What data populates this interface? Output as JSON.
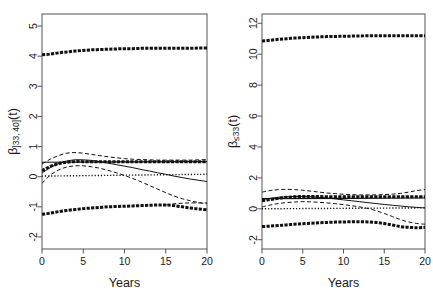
{
  "figure": {
    "type": "multi-panel-line-plot",
    "panel_count": 2,
    "background": "#ffffff",
    "line_color": "#111111"
  },
  "chart_data": [
    {
      "type": "line",
      "panel": "left",
      "title": "",
      "xlabel": "Years",
      "ylabel": "beta_]33,40](t)",
      "ylabel_parts": {
        "beta": "β",
        "subscript": "]33, 40]",
        "suffix": "(t)"
      },
      "xlim": [
        0,
        20
      ],
      "ylim": [
        -2.4,
        5.4
      ],
      "xticks": [
        0,
        5,
        10,
        15,
        20
      ],
      "xtick_labels": [
        "0",
        "5",
        "10",
        "15",
        "20"
      ],
      "yticks": [
        -2,
        -1,
        0,
        1,
        2,
        3,
        4,
        5
      ],
      "ytick_labels": [
        "-2",
        "-1",
        "0",
        "1",
        "2",
        "3",
        "4",
        "5"
      ],
      "grid": false,
      "legend": null,
      "series": [
        {
          "name": "upper-confidence-band",
          "style": "thick-dashed",
          "x": [
            0,
            1,
            2,
            3,
            4,
            5,
            6,
            7,
            8,
            9,
            10,
            11,
            12,
            13,
            14,
            15,
            16,
            17,
            18,
            19,
            20
          ],
          "values": [
            4.05,
            4.07,
            4.11,
            4.14,
            4.17,
            4.19,
            4.21,
            4.22,
            4.23,
            4.24,
            4.25,
            4.25,
            4.26,
            4.26,
            4.26,
            4.26,
            4.26,
            4.26,
            4.26,
            4.27,
            4.27
          ]
        },
        {
          "name": "lower-confidence-band",
          "style": "thick-dashed",
          "x": [
            0,
            1,
            2,
            3,
            4,
            5,
            6,
            7,
            8,
            9,
            10,
            11,
            12,
            13,
            14,
            15,
            16,
            17,
            18,
            19,
            20
          ],
          "values": [
            -1.25,
            -1.21,
            -1.16,
            -1.12,
            -1.09,
            -1.06,
            -1.04,
            -1.02,
            -1.0,
            -0.99,
            -0.98,
            -0.97,
            -0.96,
            -0.95,
            -0.94,
            -0.94,
            -0.96,
            -1.0,
            -1.04,
            -1.07,
            -1.1
          ]
        },
        {
          "name": "lower-band-upper-branch",
          "style": "dashed",
          "x": [
            15,
            16,
            17,
            18,
            19,
            20
          ],
          "values": [
            -0.94,
            -0.9,
            -0.88,
            -0.87,
            -0.87,
            -0.87
          ]
        },
        {
          "name": "constant-effect-estimate",
          "style": "solid-horizontal",
          "x": [
            0,
            20
          ],
          "values": [
            0.48,
            0.5
          ]
        },
        {
          "name": "zero-reference-line",
          "style": "dotted",
          "x": [
            0,
            20
          ],
          "values": [
            0.02,
            0.08
          ]
        },
        {
          "name": "time-varying-estimate",
          "style": "solid",
          "x": [
            0,
            1,
            2,
            3,
            4,
            5,
            6,
            7,
            8,
            9,
            10,
            11,
            12,
            13,
            14,
            15,
            16,
            17,
            18,
            19,
            20
          ],
          "values": [
            0.12,
            0.3,
            0.44,
            0.52,
            0.56,
            0.56,
            0.54,
            0.5,
            0.45,
            0.4,
            0.35,
            0.3,
            0.24,
            0.19,
            0.13,
            0.08,
            0.02,
            -0.03,
            -0.08,
            -0.12,
            -0.16
          ]
        },
        {
          "name": "time-varying-upper-ci",
          "style": "dashed",
          "x": [
            0,
            1,
            2,
            3,
            4,
            5,
            6,
            7,
            8,
            9,
            10,
            11,
            12,
            13,
            14,
            15,
            16,
            17,
            18,
            19,
            20
          ],
          "values": [
            0.42,
            0.58,
            0.7,
            0.78,
            0.8,
            0.78,
            0.74,
            0.7,
            0.66,
            0.63,
            0.6,
            0.58,
            0.57,
            0.56,
            0.55,
            0.55,
            0.55,
            0.55,
            0.55,
            0.56,
            0.57
          ]
        },
        {
          "name": "time-varying-lower-ci",
          "style": "dashed",
          "x": [
            0,
            1,
            2,
            3,
            4,
            5,
            6,
            7,
            8,
            9,
            10,
            11,
            12,
            13,
            14,
            15,
            16,
            17,
            18,
            19,
            20
          ],
          "values": [
            -0.22,
            0.05,
            0.22,
            0.32,
            0.36,
            0.36,
            0.33,
            0.28,
            0.21,
            0.13,
            0.04,
            -0.06,
            -0.17,
            -0.29,
            -0.41,
            -0.53,
            -0.64,
            -0.73,
            -0.8,
            -0.86,
            -0.9
          ]
        },
        {
          "name": "thick-dashed-mid-band",
          "style": "thick-dashed",
          "x": [
            0,
            1,
            2,
            3,
            4,
            5,
            6,
            7,
            8,
            9,
            10,
            11,
            12,
            13,
            14,
            15,
            16,
            17,
            18,
            19,
            20
          ],
          "values": [
            0.2,
            0.34,
            0.43,
            0.48,
            0.5,
            0.5,
            0.5,
            0.5,
            0.5,
            0.5,
            0.5,
            0.5,
            0.5,
            0.5,
            0.5,
            0.5,
            0.5,
            0.5,
            0.5,
            0.5,
            0.5
          ]
        }
      ]
    },
    {
      "type": "line",
      "panel": "right",
      "title": "",
      "xlabel": "Years",
      "ylabel": "beta_<=33(t)",
      "ylabel_parts": {
        "beta": "β",
        "subscript": "≤33",
        "suffix": "(t)"
      },
      "xlim": [
        0,
        20
      ],
      "ylim": [
        -2.6,
        12.6
      ],
      "xticks": [
        0,
        5,
        10,
        15,
        20
      ],
      "xtick_labels": [
        "0",
        "5",
        "10",
        "15",
        "20"
      ],
      "yticks": [
        -2,
        0,
        2,
        4,
        6,
        8,
        10,
        12
      ],
      "ytick_labels": [
        "-2",
        "0",
        "2",
        "4",
        "6",
        "8",
        "10",
        "12"
      ],
      "grid": false,
      "legend": null,
      "series": [
        {
          "name": "upper-confidence-band",
          "style": "thick-dashed",
          "x": [
            0,
            1,
            2,
            3,
            4,
            5,
            6,
            7,
            8,
            9,
            10,
            11,
            12,
            13,
            14,
            15,
            16,
            17,
            18,
            19,
            20
          ],
          "values": [
            10.85,
            10.9,
            10.96,
            11.0,
            11.04,
            11.07,
            11.1,
            11.12,
            11.14,
            11.15,
            11.16,
            11.17,
            11.18,
            11.19,
            11.2,
            11.2,
            11.2,
            11.2,
            11.2,
            11.2,
            11.2
          ]
        },
        {
          "name": "lower-confidence-band",
          "style": "thick-dashed",
          "x": [
            0,
            1,
            2,
            3,
            4,
            5,
            6,
            7,
            8,
            9,
            10,
            11,
            12,
            13,
            14,
            15,
            16,
            17,
            18,
            19,
            20
          ],
          "values": [
            -1.15,
            -1.12,
            -1.08,
            -1.04,
            -1.0,
            -0.96,
            -0.93,
            -0.9,
            -0.88,
            -0.86,
            -0.85,
            -0.84,
            -0.84,
            -0.85,
            -0.88,
            -0.95,
            -1.05,
            -1.15,
            -1.2,
            -1.22,
            -1.2
          ]
        },
        {
          "name": "constant-effect-estimate",
          "style": "solid-horizontal",
          "x": [
            0,
            20
          ],
          "values": [
            0.66,
            0.7
          ]
        },
        {
          "name": "zero-reference-line",
          "style": "dotted",
          "x": [
            0,
            20
          ],
          "values": [
            0.0,
            0.06
          ]
        },
        {
          "name": "time-varying-estimate",
          "style": "solid",
          "x": [
            0,
            1,
            2,
            3,
            4,
            5,
            6,
            7,
            8,
            9,
            10,
            11,
            12,
            13,
            14,
            15,
            16,
            17,
            18,
            19,
            20
          ],
          "values": [
            0.6,
            0.68,
            0.74,
            0.78,
            0.8,
            0.8,
            0.78,
            0.74,
            0.69,
            0.64,
            0.58,
            0.52,
            0.46,
            0.4,
            0.34,
            0.28,
            0.23,
            0.18,
            0.13,
            0.09,
            0.06
          ]
        },
        {
          "name": "time-varying-upper-ci",
          "style": "dashed",
          "x": [
            0,
            1,
            2,
            3,
            4,
            5,
            6,
            7,
            8,
            9,
            10,
            11,
            12,
            13,
            14,
            15,
            16,
            17,
            18,
            19,
            20
          ],
          "values": [
            1.08,
            1.18,
            1.24,
            1.26,
            1.24,
            1.2,
            1.14,
            1.08,
            1.02,
            0.98,
            0.94,
            0.92,
            0.9,
            0.9,
            0.9,
            0.92,
            0.95,
            1.0,
            1.08,
            1.18,
            1.24
          ]
        },
        {
          "name": "time-varying-lower-ci",
          "style": "dashed",
          "x": [
            0,
            1,
            2,
            3,
            4,
            5,
            6,
            7,
            8,
            9,
            10,
            11,
            12,
            13,
            14,
            15,
            16,
            17,
            18,
            19,
            20
          ],
          "values": [
            0.12,
            0.24,
            0.34,
            0.4,
            0.44,
            0.46,
            0.45,
            0.42,
            0.38,
            0.33,
            0.27,
            0.2,
            0.12,
            0.02,
            -0.12,
            -0.3,
            -0.5,
            -0.7,
            -0.85,
            -0.95,
            -1.0
          ]
        },
        {
          "name": "thick-dashed-mid-band",
          "style": "thick-dashed",
          "x": [
            0,
            1,
            2,
            3,
            4,
            5,
            6,
            7,
            8,
            9,
            10,
            11,
            12,
            13,
            14,
            15,
            16,
            17,
            18,
            19,
            20
          ],
          "values": [
            0.52,
            0.6,
            0.68,
            0.74,
            0.78,
            0.8,
            0.8,
            0.79,
            0.78,
            0.78,
            0.78,
            0.78,
            0.78,
            0.78,
            0.78,
            0.78,
            0.78,
            0.78,
            0.78,
            0.78,
            0.78
          ]
        }
      ]
    }
  ]
}
